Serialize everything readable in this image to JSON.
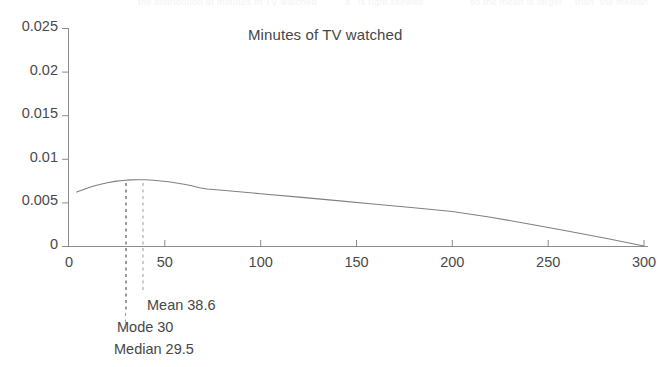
{
  "chart_data": {
    "type": "line",
    "title": "Minutes of TV watched",
    "xlabel": "",
    "ylabel": "",
    "xlim": [
      0,
      300
    ],
    "ylim": [
      0,
      0.025
    ],
    "grid": false,
    "legend": null,
    "x_ticks": [
      "0",
      "50",
      "100",
      "150",
      "200",
      "250",
      "300"
    ],
    "x_tick_values": [
      0,
      50,
      100,
      150,
      200,
      250,
      300
    ],
    "y_ticks": [
      "0",
      "0.005",
      "0.01",
      "0.015",
      "0.02",
      "0.025"
    ],
    "y_tick_values": [
      0,
      0.005,
      0.01,
      0.015,
      0.02,
      0.025
    ],
    "series": [
      {
        "name": "Minutes of TV watched (density)",
        "style": "solid",
        "color": "#808080",
        "x": [
          4,
          8,
          12,
          16,
          20,
          24,
          28,
          32,
          36,
          40,
          44,
          48,
          52,
          56,
          60,
          64,
          68,
          72,
          80,
          100,
          120,
          140,
          160,
          180,
          200,
          220,
          240,
          260,
          280,
          300
        ],
        "y": [
          0.00618,
          0.00652,
          0.00682,
          0.00706,
          0.00725,
          0.00741,
          0.00752,
          0.00758,
          0.0076,
          0.00759,
          0.00754,
          0.00746,
          0.00736,
          0.00723,
          0.00708,
          0.0069,
          0.00668,
          0.00653,
          0.00639,
          0.006,
          0.0056,
          0.0052,
          0.00479,
          0.00438,
          0.00396,
          0.0033,
          0.00252,
          0.00172,
          0.00088,
          0.0
        ]
      }
    ],
    "annotations": [
      {
        "id": "mean",
        "label": "Mean 38.6",
        "value": 38.6,
        "line": "dashed",
        "line_color": "#9a9a9a"
      },
      {
        "id": "mode",
        "label": "Mode 30",
        "value": 30,
        "line": "dashed",
        "line_color": "#9a9a9a"
      },
      {
        "id": "median",
        "label": "Median 29.5",
        "value": 29.5,
        "line": "dashed",
        "line_color": "#9a9a9a"
      }
    ],
    "axis_color": "#8c8c8c",
    "text_color": "#474747"
  },
  "ghost_text": {
    "fragments": [
      "the distribution of minutes of TV watched",
      "a",
      "is right skewed",
      "so the mean is larger",
      "than",
      "the median"
    ]
  }
}
